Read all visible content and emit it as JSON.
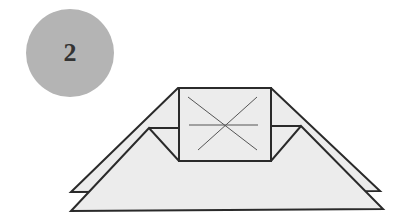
{
  "step": {
    "number": "2",
    "color": "#b4b4b4"
  },
  "diagram": {
    "fill": "#ececec",
    "stroke": "#2a2a2a"
  }
}
